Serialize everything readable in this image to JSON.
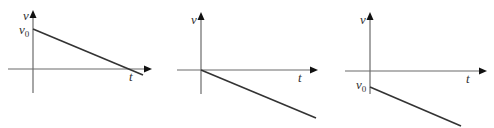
{
  "colors": {
    "axis": "#6b6b6b",
    "line": "#333333",
    "text": "#333333"
  },
  "graphs": [
    {
      "id": "graph-1",
      "y_label": "v",
      "x_label": "t",
      "v0_label": "v",
      "v0_sub": "0",
      "origin": [
        33,
        69
      ],
      "y_axis_top": 10,
      "y_axis_bottom": 93,
      "x_axis_left": 8,
      "x_axis_tip": 152,
      "line": [
        [
          33,
          29
        ],
        [
          143,
          75
        ]
      ],
      "y_label_pos": [
        23,
        20
      ],
      "v0_pos": [
        19,
        34
      ],
      "x_label_pos": [
        129,
        81
      ]
    },
    {
      "id": "graph-2",
      "y_label": "v",
      "x_label": "t",
      "v0_label": "",
      "v0_sub": "",
      "origin": [
        201,
        70
      ],
      "y_axis_top": 12,
      "y_axis_bottom": 94,
      "x_axis_left": 177,
      "x_axis_tip": 318,
      "line": [
        [
          201,
          70
        ],
        [
          316,
          118
        ]
      ],
      "y_label_pos": [
        191,
        24
      ],
      "v0_pos": [
        0,
        0
      ],
      "x_label_pos": [
        298,
        82
      ]
    },
    {
      "id": "graph-3",
      "y_label": "v",
      "x_label": "t",
      "v0_label": "v",
      "v0_sub": "0",
      "origin": [
        370,
        71
      ],
      "y_axis_top": 12,
      "y_axis_bottom": 94,
      "x_axis_left": 345,
      "x_axis_tip": 487,
      "line": [
        [
          370,
          87
        ],
        [
          461,
          126
        ]
      ],
      "y_label_pos": [
        360,
        24
      ],
      "v0_pos": [
        356,
        89
      ],
      "x_label_pos": [
        466,
        83
      ]
    }
  ]
}
